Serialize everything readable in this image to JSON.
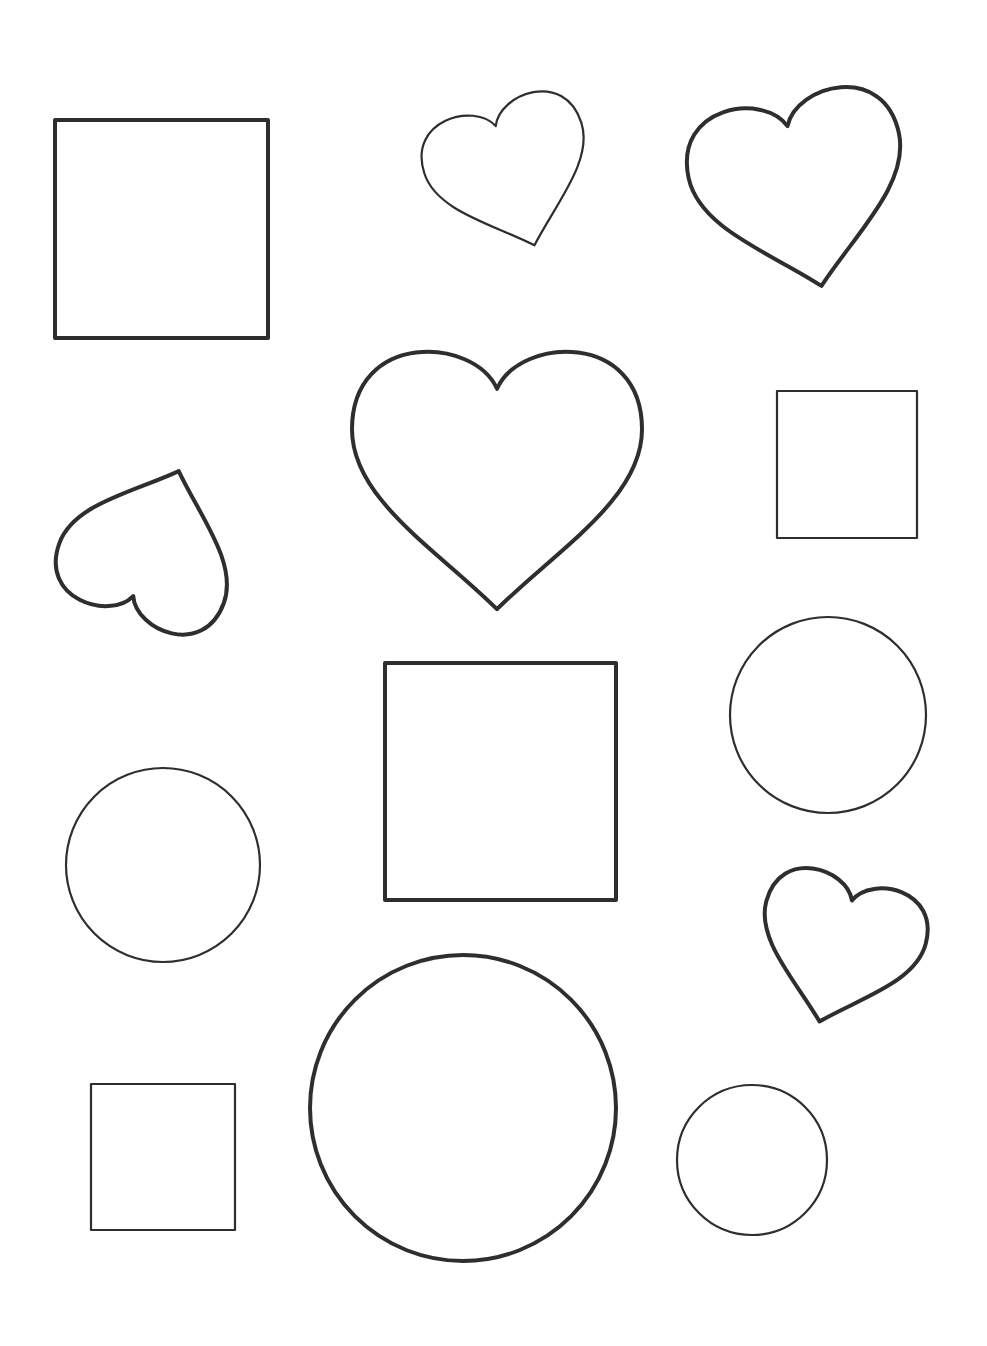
{
  "page": {
    "background": "#ffffff",
    "stroke_color": "#2e2e2e"
  },
  "shapes": [
    {
      "id": "square-1",
      "type": "square",
      "x": 55,
      "y": 120,
      "w": 213,
      "h": 218,
      "stroke": 4
    },
    {
      "id": "heart-1",
      "type": "heart",
      "cx": 510,
      "cy": 170,
      "size": 165,
      "rotate": -18,
      "stroke": 2.2
    },
    {
      "id": "heart-2",
      "type": "heart",
      "cx": 800,
      "cy": 185,
      "size": 215,
      "rotate": -12,
      "stroke": 4
    },
    {
      "id": "heart-3",
      "type": "heart",
      "cx": 497,
      "cy": 470,
      "size": 290,
      "rotate": 0,
      "stroke": 4
    },
    {
      "id": "square-2",
      "type": "square",
      "x": 777,
      "y": 391,
      "w": 140,
      "h": 147,
      "stroke": 2.2
    },
    {
      "id": "heart-4",
      "type": "heart",
      "cx": 150,
      "cy": 550,
      "size": 175,
      "rotate": 200,
      "stroke": 4
    },
    {
      "id": "square-3",
      "type": "square",
      "x": 385,
      "y": 663,
      "w": 231,
      "h": 237,
      "stroke": 4
    },
    {
      "id": "circle-1",
      "type": "circle",
      "cx": 828,
      "cy": 715,
      "r": 98,
      "stroke": 2.2
    },
    {
      "id": "circle-2",
      "type": "circle",
      "cx": 163,
      "cy": 865,
      "r": 97,
      "stroke": 2.2
    },
    {
      "id": "heart-5",
      "type": "heart",
      "cx": 840,
      "cy": 945,
      "size": 165,
      "rotate": 15,
      "stroke": 4
    },
    {
      "id": "circle-3",
      "type": "circle",
      "cx": 463,
      "cy": 1108,
      "r": 153,
      "stroke": 4
    },
    {
      "id": "square-4",
      "type": "square",
      "x": 91,
      "y": 1084,
      "w": 144,
      "h": 146,
      "stroke": 2.2
    },
    {
      "id": "circle-4",
      "type": "circle",
      "cx": 752,
      "cy": 1160,
      "r": 75,
      "stroke": 2.2
    }
  ]
}
